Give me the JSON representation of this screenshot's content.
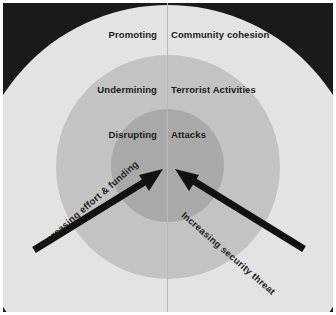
{
  "figure": {
    "type": "concentric-rings-diagram",
    "background_color": "#1a1a1a",
    "rings": [
      {
        "id": "outer",
        "color": "#e3e3e3",
        "left_label": "Promoting",
        "right_label": "Community cohesion"
      },
      {
        "id": "middle",
        "color": "#c3c3c3",
        "left_label": "Undermining",
        "right_label": "Terrorist Activities"
      },
      {
        "id": "inner",
        "color": "#a9a9a9",
        "left_label": "Disrupting",
        "right_label": "Attacks"
      }
    ],
    "arrows": [
      {
        "id": "left-arrow",
        "label": "Increasing effort & funding",
        "color": "#111111",
        "direction": "lower-left-to-center"
      },
      {
        "id": "right-arrow",
        "label": "Increasing security threat",
        "color": "#111111",
        "direction": "lower-right-to-center"
      }
    ],
    "divider_color": "#b9b9b9",
    "text_color": "#1b1b1b"
  }
}
